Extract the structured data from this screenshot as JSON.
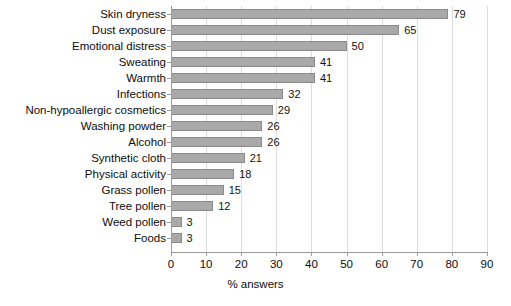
{
  "chart_data": {
    "type": "bar",
    "orientation": "horizontal",
    "title": "",
    "xlabel": "% answers",
    "ylabel": "",
    "xlim": [
      0,
      90
    ],
    "xticks": [
      0,
      10,
      20,
      30,
      40,
      50,
      60,
      70,
      80,
      90
    ],
    "grid": true,
    "legend": null,
    "categories": [
      "Skin dryness",
      "Dust exposure",
      "Emotional distress",
      "Sweating",
      "Warmth",
      "Infections",
      "Non-hypoallergic cosmetics",
      "Washing powder",
      "Alcohol",
      "Synthetic cloth",
      "Physical activity",
      "Grass pollen",
      "Tree pollen",
      "Weed pollen",
      "Foods"
    ],
    "values": [
      79,
      65,
      50,
      41,
      41,
      32,
      29,
      26,
      26,
      21,
      18,
      15,
      12,
      3,
      3
    ],
    "data_labels": [
      "79",
      "65",
      "50",
      "41",
      "41",
      "32",
      "29",
      "26",
      "26",
      "21",
      "18",
      "15",
      "12",
      "3",
      "3"
    ],
    "bar_color": "#a9a9a9",
    "bar_border_color": "#8a8a8a",
    "grid_color": "#dddddd",
    "axis_color": "#9a9a9a",
    "text_color": "#0d0d0d"
  }
}
